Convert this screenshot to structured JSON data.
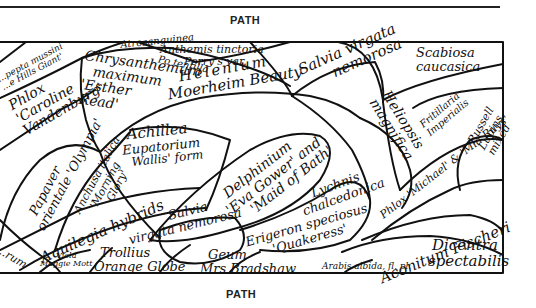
{
  "diagram": {
    "type": "garden-border-planting-plan",
    "path_labels": {
      "top": "PATH",
      "bottom": "PATH"
    },
    "plants": [
      {
        "id": "anthemis",
        "lines": [
          "Anthemis tinctoria",
          "Perry's var."
        ]
      },
      {
        "id": "potentilla",
        "lines": [
          "Po tentilla",
          "Atrosanguinea"
        ]
      },
      {
        "id": "scabiosa",
        "lines": [
          "Scabiosa",
          "caucasica"
        ]
      },
      {
        "id": "pyrethrum",
        "lines": [
          "...pepta mussini",
          "...e Hills Giant'"
        ]
      },
      {
        "id": "chrysanthemum",
        "lines": [
          "Chrysanthemum",
          "maximum",
          "'Esther",
          "Read'"
        ]
      },
      {
        "id": "helenium",
        "lines": [
          "Helenium",
          "Moerheim Beauty"
        ]
      },
      {
        "id": "salvia-top",
        "lines": [
          "Salvia virgata",
          "nemorosa"
        ]
      },
      {
        "id": "phlox-caroline",
        "lines": [
          "Phlox",
          "'Caroline",
          "Vandenburg'"
        ]
      },
      {
        "id": "heliopsis",
        "lines": [
          "Heliopsis",
          "magnifica"
        ]
      },
      {
        "id": "fritillaria",
        "lines": [
          "Fritillaria",
          "Imperialis"
        ]
      },
      {
        "id": "achillea",
        "lines": [
          "Achillea",
          "Eupatorium",
          "Wallis' form"
        ]
      },
      {
        "id": "delphinium",
        "lines": [
          "Delphinium",
          "'Eva Gower' and",
          "'Maid of Bath'"
        ]
      },
      {
        "id": "papaver",
        "lines": [
          "Papaver",
          "orientale 'Olympia'"
        ]
      },
      {
        "id": "anchusa",
        "lines": [
          "Anchusa italica",
          "'Morning",
          "Glory'"
        ]
      },
      {
        "id": "phlox-michael",
        "lines": [
          "Phlox 'Michael' & 'Mia Ruys'"
        ]
      },
      {
        "id": "russell-lupins",
        "lines": [
          "Russell",
          "Lupins",
          "mixed"
        ]
      },
      {
        "id": "lychnis",
        "lines": [
          "Lychnis",
          "chalcedonica"
        ]
      },
      {
        "id": "aquilegia",
        "lines": [
          "Aquilegia hybrids"
        ]
      },
      {
        "id": "aconitum",
        "lines": [
          "Aconitum Fischeri"
        ]
      },
      {
        "id": "salvia-bottom",
        "lines": [
          "Salvia",
          "virgata nemorosa"
        ]
      },
      {
        "id": "erigeron",
        "lines": [
          "Erigeron speciosus",
          "'Quakeress'"
        ]
      },
      {
        "id": "dicentra",
        "lines": [
          "Dicentra",
          "spectabilis"
        ]
      },
      {
        "id": "sedum-edge",
        "lines": [
          "...rum"
        ]
      },
      {
        "id": "viola",
        "lines": [
          "Viola",
          "Maggie Mott"
        ]
      },
      {
        "id": "trollius",
        "lines": [
          "Trollius",
          "Orange Globe"
        ]
      },
      {
        "id": "geum",
        "lines": [
          "Geum",
          "Mrs Bradshaw"
        ]
      },
      {
        "id": "arabis",
        "lines": [
          "Arabis albida, fl, pl."
        ]
      }
    ]
  }
}
